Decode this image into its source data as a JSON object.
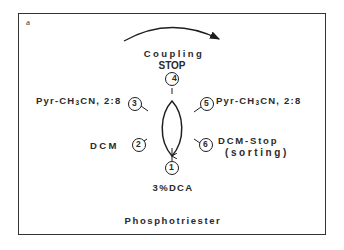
{
  "figure": {
    "panel_letter": "a",
    "title": "Phosphotriester",
    "cycle_direction": "clockwise",
    "top_label": {
      "line1": "Coupling",
      "line2": "STOP"
    },
    "steps": [
      {
        "number": "1",
        "label": "3%DCA"
      },
      {
        "number": "2",
        "label": "DCM"
      },
      {
        "number": "3",
        "label_prefix": "Pyr-CH",
        "label_sub": "3",
        "label_suffix": "CN, 2:8"
      },
      {
        "number": "4",
        "label": "Coupling STOP"
      },
      {
        "number": "5",
        "label_prefix": "Pyr-CH",
        "label_sub": "3",
        "label_suffix": "CN, 2:8"
      },
      {
        "number": "6",
        "label_line1": "DCM-Stop",
        "label_line2": "(sorting)"
      }
    ],
    "colors": {
      "ink": "#1e1e1e",
      "frame": "#333333",
      "background": "#ffffff"
    }
  }
}
